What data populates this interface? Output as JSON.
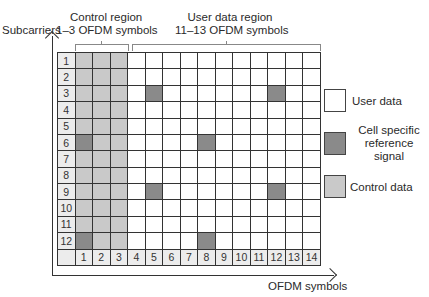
{
  "labels": {
    "y_axis": "Subcarriers",
    "x_axis": "OFDM symbols",
    "control_region_title": "Control region",
    "control_region_sub": "1–3 OFDM symbols",
    "user_region_title": "User data region",
    "user_region_sub": "11–13 OFDM symbols"
  },
  "legend": [
    {
      "key": "user",
      "lines": [
        "User data"
      ],
      "color": "#ffffff"
    },
    {
      "key": "crs",
      "lines": [
        "Cell specific",
        "reference",
        "signal"
      ],
      "color": "#8a8a8a"
    },
    {
      "key": "ctrl",
      "lines": [
        "Control data"
      ],
      "color": "#c9c9c9"
    }
  ],
  "grid": {
    "rows": [
      "1",
      "2",
      "3",
      "4",
      "5",
      "6",
      "7",
      "8",
      "9",
      "10",
      "11",
      "12"
    ],
    "columns": [
      "1",
      "2",
      "3",
      "4",
      "5",
      "6",
      "7",
      "8",
      "9",
      "10",
      "11",
      "12",
      "13",
      "14"
    ],
    "control_columns": [
      1,
      2,
      3
    ],
    "reference_signals": [
      {
        "row": 3,
        "col": 5
      },
      {
        "row": 3,
        "col": 12
      },
      {
        "row": 6,
        "col": 1
      },
      {
        "row": 6,
        "col": 8
      },
      {
        "row": 9,
        "col": 5
      },
      {
        "row": 9,
        "col": 12
      },
      {
        "row": 12,
        "col": 1
      },
      {
        "row": 12,
        "col": 8
      }
    ]
  },
  "colors": {
    "user_data": "#ffffff",
    "reference_signal": "#8a8a8a",
    "control_data": "#c9c9c9",
    "label_cell": "#ececec"
  }
}
